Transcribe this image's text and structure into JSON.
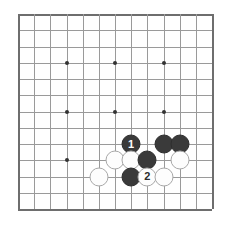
{
  "diagram": {
    "kind": "go-board-diagram",
    "board_size": 13,
    "grid_columns": 13,
    "grid_rows": 13,
    "colors": {
      "background": "#ffffff",
      "grid_line": "#9a9a9a",
      "board_edge": "#6e6e6e",
      "star_point": "#333333",
      "black_stone": "#3a3a3a",
      "white_stone": "#fdfdfd",
      "white_stone_outline": "#a8a8a8",
      "black_label_text": "#ffffff",
      "white_label_text": "#2b2b2b"
    },
    "star_points": [
      {
        "col": 3,
        "row": 3
      },
      {
        "col": 6,
        "row": 3
      },
      {
        "col": 9,
        "row": 3
      },
      {
        "col": 3,
        "row": 6
      },
      {
        "col": 6,
        "row": 6
      },
      {
        "col": 9,
        "row": 6
      },
      {
        "col": 3,
        "row": 9
      }
    ],
    "stones": [
      {
        "col": 7,
        "row": 8,
        "color": "black",
        "label": "1"
      },
      {
        "col": 9,
        "row": 8,
        "color": "black",
        "label": ""
      },
      {
        "col": 10,
        "row": 8,
        "color": "black",
        "label": ""
      },
      {
        "col": 6,
        "row": 9,
        "color": "white",
        "label": ""
      },
      {
        "col": 7,
        "row": 9,
        "color": "white",
        "label": ""
      },
      {
        "col": 8,
        "row": 9,
        "color": "black",
        "label": ""
      },
      {
        "col": 10,
        "row": 9,
        "color": "white",
        "label": ""
      },
      {
        "col": 5,
        "row": 10,
        "color": "white",
        "label": ""
      },
      {
        "col": 7,
        "row": 10,
        "color": "black",
        "label": ""
      },
      {
        "col": 8,
        "row": 10,
        "color": "white",
        "label": "2"
      },
      {
        "col": 9,
        "row": 10,
        "color": "white",
        "label": ""
      }
    ]
  }
}
